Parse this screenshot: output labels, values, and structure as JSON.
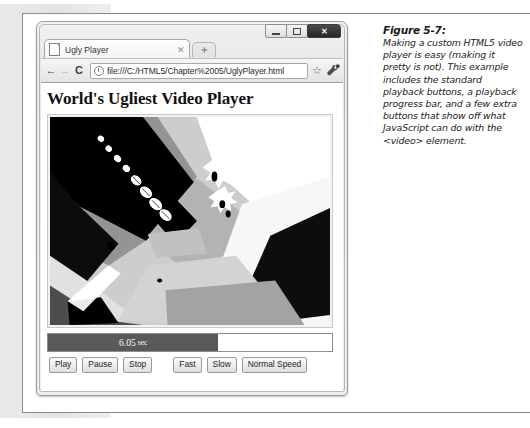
{
  "figure": {
    "number_label": "Figure 5-7:",
    "caption": "Making a custom HTML5 video player is easy (making it pretty is not). This example includes the standard playback buttons, a playback progress bar, and a few extra buttons that show off what JavaScript can do with the <video> element."
  },
  "browser": {
    "window_controls": {
      "minimize_label": "",
      "maximize_label": "",
      "close_label": "✕"
    },
    "tab": {
      "title": "Ugly Player",
      "close_label": "✕",
      "new_tab_label": "✛"
    },
    "toolbar": {
      "back_label": "←",
      "forward_label": "→",
      "reload_label": "C",
      "bookmark_star_label": "☆",
      "url": "file:///C:/HTML5/Chapter%2005/UglyPlayer.html"
    }
  },
  "page": {
    "heading": "World's Ugliest Video Player",
    "progress": {
      "time_value": "6.05",
      "time_unit": "sec",
      "percent": 60
    },
    "controls": [
      {
        "label": "Play",
        "name": "play-button"
      },
      {
        "label": "Pause",
        "name": "pause-button"
      },
      {
        "label": "Stop",
        "name": "stop-button"
      },
      {
        "label": "Fast",
        "name": "fast-button"
      },
      {
        "label": "Slow",
        "name": "slow-button"
      },
      {
        "label": "Normal Speed",
        "name": "normal-speed-button"
      }
    ]
  },
  "colors": {
    "progress_fill": "#595959",
    "frame_border": "#9d9d9d",
    "page_background": "#ffffff"
  }
}
